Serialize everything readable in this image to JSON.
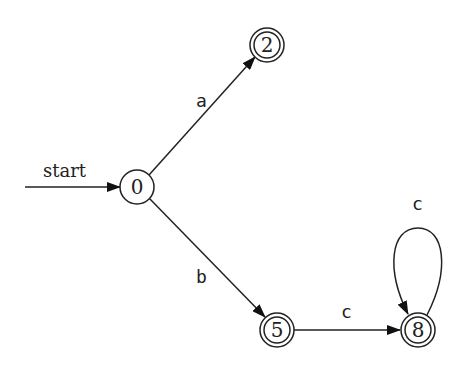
{
  "diagram": {
    "type": "finite-automaton",
    "start_label": "start",
    "states": [
      {
        "id": "0",
        "label": "0",
        "accepting": false,
        "start": true
      },
      {
        "id": "2",
        "label": "2",
        "accepting": true
      },
      {
        "id": "5",
        "label": "5",
        "accepting": true
      },
      {
        "id": "8",
        "label": "8",
        "accepting": true
      }
    ],
    "transitions": [
      {
        "from": "0",
        "to": "2",
        "label": "a"
      },
      {
        "from": "0",
        "to": "5",
        "label": "b"
      },
      {
        "from": "5",
        "to": "8",
        "label": "c"
      },
      {
        "from": "8",
        "to": "8",
        "label": "c"
      }
    ]
  }
}
